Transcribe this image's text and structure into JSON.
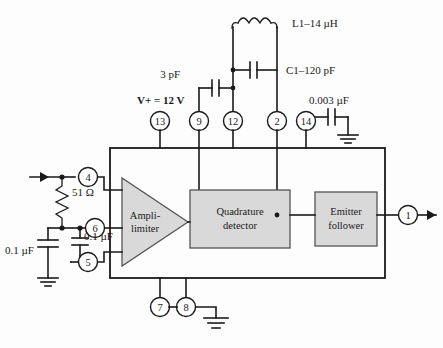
{
  "diagram": {
    "supply_label": "V+ = 12 V",
    "blocks": [
      {
        "id": "ampli-limiter",
        "line1": "Ampli-",
        "line2": "limiter",
        "shape": "triangle"
      },
      {
        "id": "quadrature-detector",
        "line1": "Quadrature",
        "line2": "detector",
        "shape": "rect"
      },
      {
        "id": "emitter-follower",
        "line1": "Emitter",
        "line2": "follower",
        "shape": "rect"
      }
    ],
    "pins": [
      {
        "id": "pin-13",
        "label": "13"
      },
      {
        "id": "pin-9",
        "label": "9"
      },
      {
        "id": "pin-12",
        "label": "12"
      },
      {
        "id": "pin-2",
        "label": "2"
      },
      {
        "id": "pin-14",
        "label": "14"
      },
      {
        "id": "pin-4",
        "label": "4"
      },
      {
        "id": "pin-6",
        "label": "6"
      },
      {
        "id": "pin-5",
        "label": "5"
      },
      {
        "id": "pin-7",
        "label": "7"
      },
      {
        "id": "pin-8",
        "label": "8"
      },
      {
        "id": "pin-1",
        "label": "1"
      }
    ],
    "components": [
      {
        "id": "inductor-l1",
        "label": "L1–14 µH",
        "type": "inductor"
      },
      {
        "id": "capacitor-c1",
        "label": "C1–120 pF",
        "type": "capacitor"
      },
      {
        "id": "capacitor-3pf",
        "label": "3 pF",
        "type": "capacitor"
      },
      {
        "id": "capacitor-003",
        "label": "0.003 µF",
        "type": "capacitor"
      },
      {
        "id": "resistor-51",
        "label": "51 Ω",
        "type": "resistor"
      },
      {
        "id": "capacitor-01a",
        "label": "0.1 µF",
        "type": "capacitor"
      },
      {
        "id": "capacitor-01b",
        "label": "0.1 µF",
        "type": "capacitor"
      }
    ],
    "colors": {
      "wire": "#1a1a1a",
      "block_fill": "#d9d9d9",
      "block_stroke": "#555555",
      "background": "#fdfdfd"
    }
  }
}
